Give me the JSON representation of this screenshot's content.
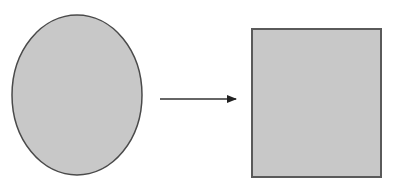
{
  "diagram": {
    "shapes": [
      {
        "id": "source",
        "type": "ellipse",
        "cx": 77,
        "cy": 95,
        "rx": 65,
        "ry": 80,
        "fill": "#c8c8c8",
        "stroke": "#4a4a4a"
      },
      {
        "id": "target",
        "type": "rectangle",
        "x": 252,
        "y": 29,
        "width": 129,
        "height": 148,
        "fill": "#c8c8c8",
        "stroke": "#5a5a5a"
      }
    ],
    "arrow": {
      "x1": 160,
      "y1": 99,
      "x2": 236,
      "y2": 99,
      "color": "#333333"
    }
  }
}
